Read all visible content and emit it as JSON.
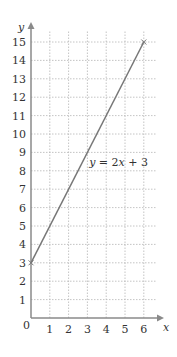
{
  "chart_data": {
    "type": "line",
    "title": "",
    "xlabel": "x",
    "ylabel": "y",
    "xlim": [
      0,
      6.8
    ],
    "ylim": [
      0,
      15.8
    ],
    "x_ticks": [
      0,
      1,
      2,
      3,
      4,
      5,
      6
    ],
    "y_ticks": [
      1,
      2,
      3,
      4,
      5,
      6,
      7,
      8,
      9,
      10,
      11,
      12,
      13,
      14,
      15
    ],
    "origin_label": "0",
    "grid": true,
    "series": [
      {
        "name": "y = 2x + 3",
        "x": [
          0,
          6
        ],
        "y": [
          3,
          15
        ],
        "color": "#777777",
        "marker": "x"
      }
    ],
    "annotations": [
      {
        "text_parts": [
          "y",
          " = 2",
          "x",
          " + 3"
        ],
        "text": "y = 2x + 3",
        "x": 3.2,
        "y": 8.5
      }
    ]
  },
  "colors": {
    "axis": "#8a8a8a",
    "grid": "#b5b5b5",
    "line": "#777777",
    "text": "#333333"
  }
}
